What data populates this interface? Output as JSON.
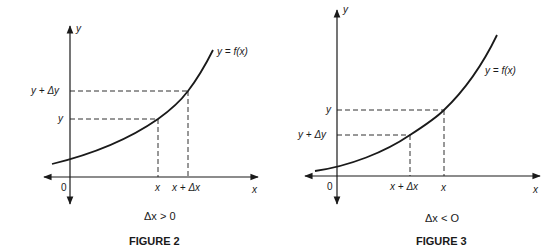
{
  "figures": [
    {
      "id": "figure-2",
      "caption": "FIGURE 2",
      "condition": "Δx > 0",
      "y_axis_label": "y",
      "x_axis_label": "x",
      "origin_label": "0",
      "curve_label": "y = f(x)",
      "y_ticks": {
        "upper": "y + Δy",
        "lower": "y"
      },
      "x_ticks": {
        "left": "x",
        "right": "x + Δx"
      }
    },
    {
      "id": "figure-3",
      "caption": "FIGURE 3",
      "condition": "Δx < O",
      "y_axis_label": "y",
      "x_axis_label": "x",
      "origin_label": "0",
      "curve_label": "y = f(x)",
      "y_ticks": {
        "upper": "y",
        "lower": "y + Δy"
      },
      "x_ticks": {
        "left": "x + Δx",
        "right": "x"
      }
    }
  ],
  "colors": {
    "ink": "#1a1a1a",
    "background": "#ffffff"
  }
}
